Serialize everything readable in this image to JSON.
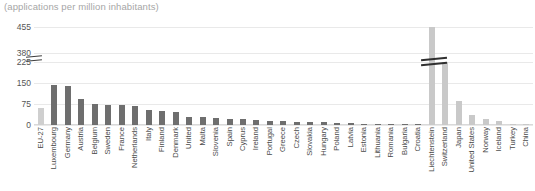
{
  "chart_data": {
    "type": "bar",
    "title": "(applications per million inhabitants)",
    "subtitle": "",
    "xlabel": "",
    "ylabel": "",
    "ylim": [
      0,
      455
    ],
    "yticks": [
      "0",
      "75",
      "150",
      "225",
      "380",
      "455"
    ],
    "axis_break": {
      "present": true,
      "between": [
        225,
        380
      ],
      "note": "broken y-axis"
    },
    "grid": true,
    "legend_position": "none",
    "categories": [
      "EU-27",
      "Luxembourg",
      "Germany",
      "Austria",
      "Belgium",
      "Sweden",
      "France",
      "Netherlands",
      "Italy",
      "Finland",
      "Denmark",
      "United",
      "Malta",
      "Slovenia",
      "Spain",
      "Cyprus",
      "Ireland",
      "Portugal",
      "Greece",
      "Czech",
      "Slovakia",
      "Hungary",
      "Poland",
      "Latvia",
      "Estonia",
      "Lithuania",
      "Romania",
      "Bulgaria",
      "Croatia",
      "Liechtenstein",
      "Switzerland",
      "Japan",
      "United States",
      "Norway",
      "Iceland",
      "Turkey",
      "China"
    ],
    "values": [
      60,
      143,
      140,
      93,
      75,
      72,
      70,
      68,
      52,
      50,
      48,
      30,
      28,
      26,
      22,
      20,
      19,
      15,
      13,
      12,
      10,
      9,
      7,
      6,
      5,
      5,
      3,
      3,
      2,
      455,
      240,
      85,
      35,
      22,
      14,
      3,
      2
    ],
    "group_of": [
      "agg",
      "eu",
      "eu",
      "eu",
      "eu",
      "eu",
      "eu",
      "eu",
      "eu",
      "eu",
      "eu",
      "eu",
      "eu",
      "eu",
      "eu",
      "eu",
      "eu",
      "eu",
      "eu",
      "eu",
      "eu",
      "eu",
      "eu",
      "eu",
      "eu",
      "eu",
      "eu",
      "eu",
      "eu",
      "noneu",
      "noneu",
      "noneu",
      "noneu",
      "noneu",
      "noneu",
      "noneu",
      "noneu"
    ],
    "colors": {
      "eu_bar": "#6e6e6e",
      "non_eu_bar": "#c9c9c9",
      "aggregate_bar": "#cfcfcf",
      "gridline": "#e9e9e9",
      "title_text": "#a6a6a6",
      "tick_text": "#555555"
    }
  }
}
